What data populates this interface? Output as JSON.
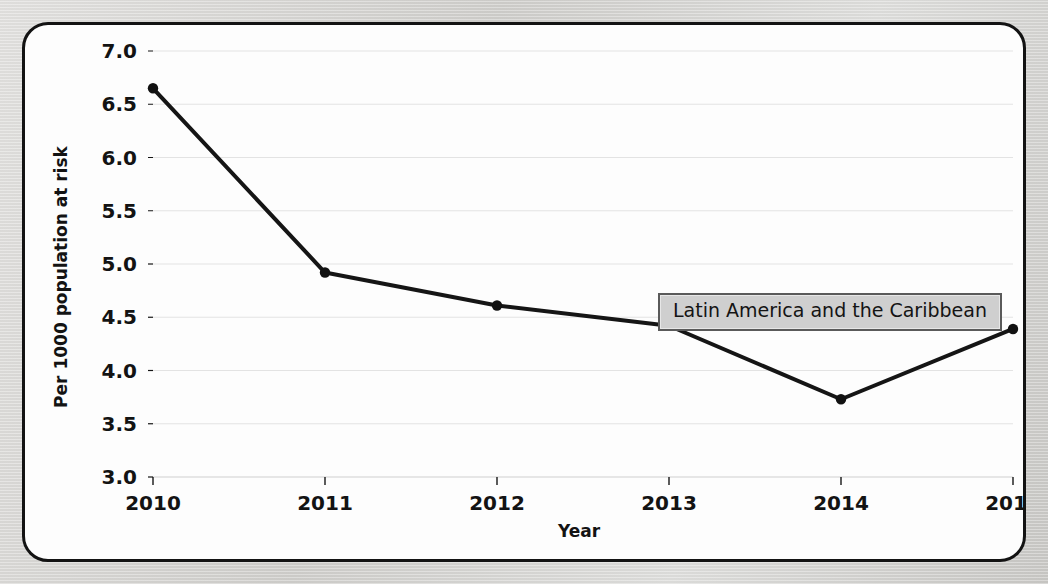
{
  "chart_data": {
    "type": "line",
    "title": "",
    "subtitle": "",
    "xlabel": "Year",
    "ylabel": "Per 1000 population at risk",
    "categories": [
      "2010",
      "2011",
      "2012",
      "2013",
      "2014",
      "2015"
    ],
    "x": [
      2010,
      2011,
      2012,
      2013,
      2014,
      2015
    ],
    "series": [
      {
        "name": "Latin America and the Caribbean",
        "values": [
          6.65,
          4.92,
          4.61,
          4.42,
          3.73,
          4.39
        ]
      }
    ],
    "ylim": [
      3.0,
      7.0
    ],
    "xlim": [
      2010,
      2015
    ],
    "yticks": [
      "3.0",
      "3.5",
      "4.0",
      "4.5",
      "5.0",
      "5.5",
      "6.0",
      "6.5",
      "7.0"
    ],
    "ytick_values": [
      3.0,
      3.5,
      4.0,
      4.5,
      5.0,
      5.5,
      6.0,
      6.5,
      7.0
    ],
    "xticks": [
      "2010",
      "2011",
      "2012",
      "2013",
      "2014",
      "2015"
    ],
    "grid": true,
    "grid_axis": "y",
    "legend_position": "inside-right",
    "marker": "circle",
    "line_color": "#151515",
    "marker_color": "#111111",
    "grid_color": "#e3e3e3",
    "axis_color": "#151515",
    "plot_background": "#fdfdfd",
    "page_background": "#d6d5d3"
  },
  "legend": {
    "label": "Latin America and the Caribbean"
  },
  "axes": {
    "x_title": "Year",
    "y_title": "Per 1000 population at risk"
  }
}
